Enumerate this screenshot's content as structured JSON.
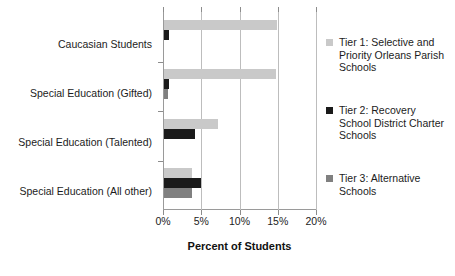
{
  "chart_data": {
    "type": "bar",
    "orientation": "horizontal",
    "title": "",
    "xlabel": "Percent of Students",
    "ylabel": "",
    "xlim": [
      0,
      20
    ],
    "xticks": [
      0,
      5,
      10,
      15,
      20
    ],
    "xtick_labels": [
      "0%",
      "5%",
      "10%",
      "15%",
      "20%"
    ],
    "grid": "vertical",
    "legend_position": "right",
    "categories": [
      "Caucasian Students",
      "Special Education (Gifted)",
      "Special Education (Talented)",
      "Special Education (All other)"
    ],
    "series": [
      {
        "name": "Tier 1: Selective and Priority Orleans Parish Schools",
        "short_name": "Tier 1",
        "color": "#c9c9c9",
        "values": [
          14.8,
          14.7,
          7.1,
          3.7
        ]
      },
      {
        "name": "Tier 2: Recovery School District Charter Schools",
        "short_name": "Tier 2",
        "color": "#1a1a1a",
        "values": [
          0.6,
          0.7,
          4.1,
          4.9
        ]
      },
      {
        "name": "Tier 3: Alternative Schools",
        "short_name": "Tier 3",
        "color": "#808080",
        "values": [
          0.0,
          0.5,
          0.0,
          3.6
        ]
      }
    ]
  },
  "axis": {
    "x_title": "Percent of Students",
    "tick_labels": [
      "0%",
      "5%",
      "10%",
      "15%",
      "20%"
    ]
  },
  "categories": {
    "c0": "Caucasian Students",
    "c1": "Special Education (Gifted)",
    "c2": "Special Education (Talented)",
    "c3": "Special Education (All other)"
  },
  "legend": {
    "items": [
      {
        "label": "Tier 1: Selective and Priority Orleans Parish Schools",
        "color": "#c9c9c9"
      },
      {
        "label": "Tier 2: Recovery School District Charter Schools",
        "color": "#1a1a1a"
      },
      {
        "label": "Tier 3: Alternative Schools",
        "color": "#808080"
      }
    ]
  }
}
